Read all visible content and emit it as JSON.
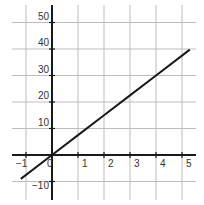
{
  "chart_data": {
    "type": "line",
    "title": "",
    "xlabel": "",
    "ylabel": "",
    "xlim": [
      -1.5,
      5.5
    ],
    "ylim": [
      -12,
      57
    ],
    "grid": true,
    "x_ticks": [
      -1,
      0,
      1,
      2,
      3,
      4,
      5
    ],
    "x_tick_labels": [
      "−1",
      "0",
      "1",
      "2",
      "3",
      "4",
      "5"
    ],
    "y_ticks": [
      -10,
      10,
      20,
      30,
      40,
      50
    ],
    "y_tick_labels": [
      "−10",
      "10",
      "20",
      "30",
      "40",
      "50"
    ],
    "series": [
      {
        "name": "y = 7.5x",
        "x": [
          -1.2,
          0,
          1,
          2,
          3,
          4,
          5,
          5.3
        ],
        "y": [
          -9,
          0,
          7.5,
          15,
          22.5,
          30,
          37.5,
          39.75
        ]
      }
    ],
    "colors": {
      "grid": "#bdbdbd",
      "axis": "#1a1a1a",
      "line": "#1a1a1a",
      "text": "#333333"
    }
  }
}
